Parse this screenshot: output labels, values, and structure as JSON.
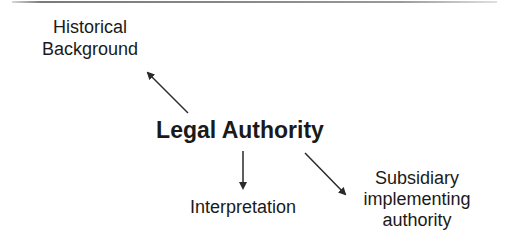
{
  "diagram": {
    "type": "concept-map",
    "center": {
      "id": "legal-authority",
      "label": "Legal Authority"
    },
    "nodes": [
      {
        "id": "historical-background",
        "lines": [
          "Historical",
          "Background"
        ]
      },
      {
        "id": "interpretation",
        "lines": [
          "Interpretation"
        ]
      },
      {
        "id": "subsidiary-implementing-authority",
        "lines": [
          "Subsidiary",
          "implementing",
          "authority"
        ]
      }
    ],
    "edges": [
      {
        "from": "legal-authority",
        "to": "historical-background",
        "direction": "up-left"
      },
      {
        "from": "legal-authority",
        "to": "interpretation",
        "direction": "down"
      },
      {
        "from": "legal-authority",
        "to": "subsidiary-implementing-authority",
        "direction": "down-right"
      }
    ],
    "colors": {
      "text": "#1a1a1a",
      "arrow": "#2a2a2a",
      "background": "#ffffff",
      "top_rule": "#8a8a8a"
    }
  }
}
